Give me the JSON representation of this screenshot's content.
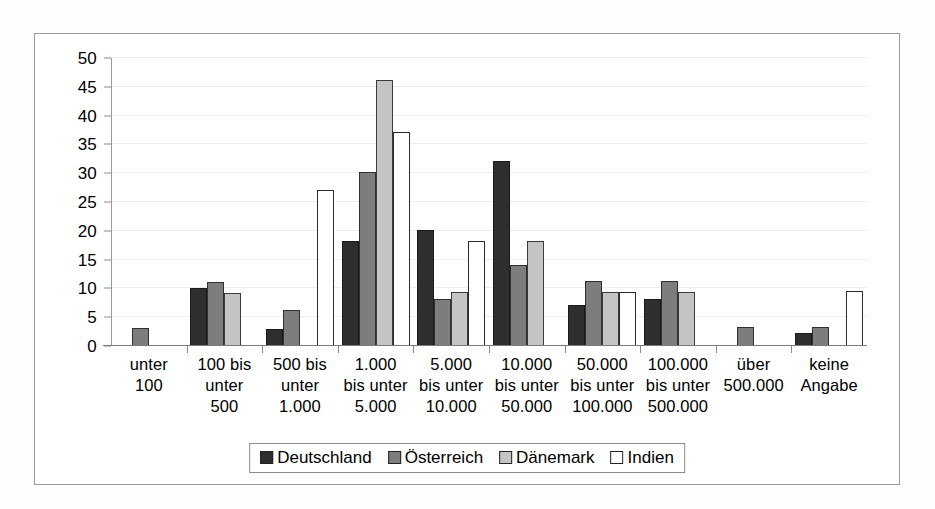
{
  "chart_data": {
    "type": "bar",
    "title": "",
    "subtitle": "",
    "xlabel": "",
    "ylabel": "",
    "ylim": [
      0,
      50
    ],
    "yticks": [
      0,
      5,
      10,
      15,
      20,
      25,
      30,
      35,
      40,
      45,
      50
    ],
    "grid": true,
    "legend_position": "bottom",
    "categories": [
      "unter\n100",
      "100 bis\nunter\n500",
      "500 bis\nunter\n1.000",
      "1.000\nbis unter\n5.000",
      "5.000\nbis unter\n10.000",
      "10.000\nbis unter\n50.000",
      "50.000\nbis unter\n100.000",
      "100.000\nbis unter\n500.000",
      "über\n500.000",
      "keine\nAngabe"
    ],
    "series": [
      {
        "name": "Deutschland",
        "color": "#2e2e2e",
        "values": [
          0,
          10.0,
          3.0,
          18.2,
          20.1,
          32.2,
          7.1,
          8.2,
          0,
          2.2
        ]
      },
      {
        "name": "Österreich",
        "color": "#7d7d7d",
        "values": [
          3.1,
          11.2,
          6.2,
          30.2,
          8.1,
          14.1,
          11.3,
          11.3,
          3.3,
          3.3
        ]
      },
      {
        "name": "Dänemark",
        "color": "#c4c4c4",
        "values": [
          0,
          9.2,
          0,
          46.1,
          9.3,
          18.3,
          9.4,
          9.4,
          0,
          0
        ]
      },
      {
        "name": "Indien",
        "color": "#ffffff",
        "values": [
          0,
          0,
          27.0,
          37.1,
          18.3,
          0,
          9.4,
          0,
          0,
          9.6
        ]
      }
    ]
  },
  "legend": {
    "items": [
      {
        "label": "Deutschland"
      },
      {
        "label": "Österreich"
      },
      {
        "label": "Dänemark"
      },
      {
        "label": "Indien"
      }
    ]
  }
}
